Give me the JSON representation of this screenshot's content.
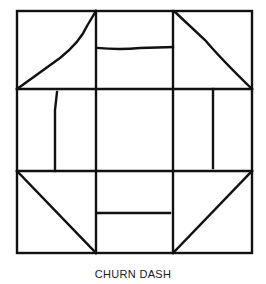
{
  "title": "CHURN DASH",
  "colors": {
    "ink": "#111111",
    "paper": "#ffffff"
  },
  "block": {
    "outer": {
      "left": 17,
      "top": 11,
      "right": 252,
      "bottom": 253
    },
    "grid_x": [
      96,
      173
    ],
    "grid_y": [
      89,
      171
    ],
    "triangles": [
      {
        "name": "top-left",
        "pts": "17,89 96,11"
      },
      {
        "name": "top-right",
        "pts": "173,11 252,89"
      },
      {
        "name": "bottom-left",
        "pts": "17,171 96,253"
      },
      {
        "name": "bottom-right",
        "pts": "173,253 252,171"
      }
    ],
    "dashes": [
      {
        "name": "top",
        "x1": 97,
        "y1": 48,
        "x2": 173,
        "y2": 48
      },
      {
        "name": "bottom",
        "x1": 97,
        "y1": 213,
        "x2": 170,
        "y2": 213
      },
      {
        "name": "left",
        "x1": 55,
        "y1": 92,
        "x2": 55,
        "y2": 171
      },
      {
        "name": "right",
        "x1": 213,
        "y1": 89,
        "x2": 213,
        "y2": 168
      }
    ]
  }
}
